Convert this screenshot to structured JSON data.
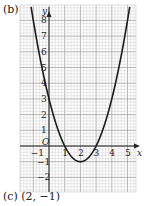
{
  "part_label": "(b)",
  "caption": "(c) (2, −1)",
  "chart_data": {
    "type": "line",
    "title": "",
    "xlabel": "x",
    "ylabel": "y",
    "origin_label": "O",
    "function": "y = x^2 - 4x + 3",
    "series": [
      {
        "name": "parabola",
        "x": [
          -1,
          0,
          1,
          2,
          3,
          4,
          5
        ],
        "y": [
          8,
          3,
          0,
          -1,
          0,
          3,
          8
        ]
      }
    ],
    "vertex": [
      2,
      -1
    ],
    "roots": [
      1,
      3
    ],
    "y_intercept": 3,
    "x_ticks": [
      "-1",
      "1",
      "2",
      "3",
      "4",
      "5"
    ],
    "y_ticks": [
      "-2",
      "-1",
      "1",
      "2",
      "3",
      "4",
      "5",
      "6",
      "7",
      "8"
    ],
    "xlim": [
      -1.9,
      5.6
    ],
    "ylim": [
      -2.9,
      9
    ],
    "grid": true,
    "legend": "none"
  },
  "colors": {
    "grid_minor": "#c8c8c8",
    "grid_major": "#9a9a9a",
    "axis": "#222222",
    "curve": "#1a1a1a"
  }
}
